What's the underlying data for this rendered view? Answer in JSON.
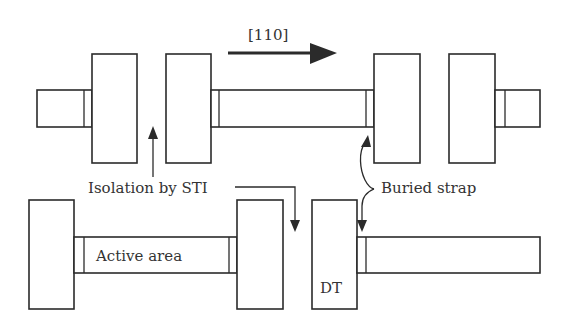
{
  "diagram": {
    "direction_label": "[110]",
    "labels": {
      "isolation": "Isolation by STI",
      "buried_strap": "Buried strap",
      "active_area": "Active area",
      "deep_trench": "DT"
    },
    "colors": {
      "stroke": "#2b2b2b",
      "fill": "#ffffff",
      "text": "#333333"
    },
    "top_row": {
      "elements": [
        "stub-left",
        "trench-1",
        "trench-2",
        "active-strip",
        "trench-3",
        "trench-4",
        "stub-right"
      ]
    },
    "bottom_row": {
      "elements": [
        "trench-left",
        "active-area-strip",
        "trench-right",
        "deep-trench-dt",
        "active-strip-right"
      ]
    }
  }
}
